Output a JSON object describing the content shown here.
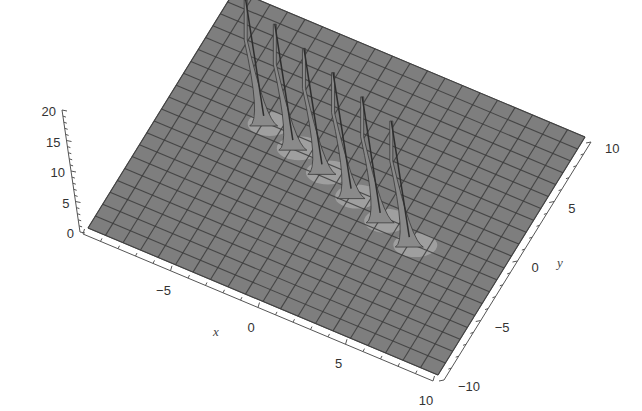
{
  "chart_data": {
    "type": "surface3d",
    "title": "",
    "xlabel": "x",
    "ylabel": "y",
    "zlabel": "",
    "xlim": [
      -10,
      10
    ],
    "ylim": [
      -10,
      10
    ],
    "zlim": [
      0,
      20
    ],
    "x_ticks": [
      -10,
      -5,
      0,
      5,
      10
    ],
    "y_ticks": [
      -10,
      -5,
      0,
      5,
      10
    ],
    "z_ticks": [
      0,
      5,
      10,
      15,
      20
    ],
    "x_tick_labels": [
      "-10",
      "−5",
      "0",
      "5",
      "10"
    ],
    "y_tick_labels": [
      "−10",
      "−5",
      "0",
      "5",
      "10"
    ],
    "z_tick_labels": [
      "0",
      "5",
      "10",
      "15",
      "20"
    ],
    "grid": true,
    "mesh_divisions": 20,
    "surface": "flat plane z≈0 with six narrow spikes (singularities) arranged in a row",
    "peaks": [
      {
        "x": -5.0,
        "y": 2.0,
        "z": 20
      },
      {
        "x": -3.0,
        "y": 1.2,
        "z": 20
      },
      {
        "x": -1.0,
        "y": 0.4,
        "z": 20
      },
      {
        "x": 1.0,
        "y": -0.4,
        "z": 20
      },
      {
        "x": 3.0,
        "y": -1.2,
        "z": 20
      },
      {
        "x": 5.0,
        "y": -2.0,
        "z": 20
      }
    ],
    "colors": {
      "surface": "#7e7e7e",
      "mesh": "#3c3c3c",
      "highlight": "#c8c8c8",
      "axis": "#555555"
    },
    "legend": null
  }
}
